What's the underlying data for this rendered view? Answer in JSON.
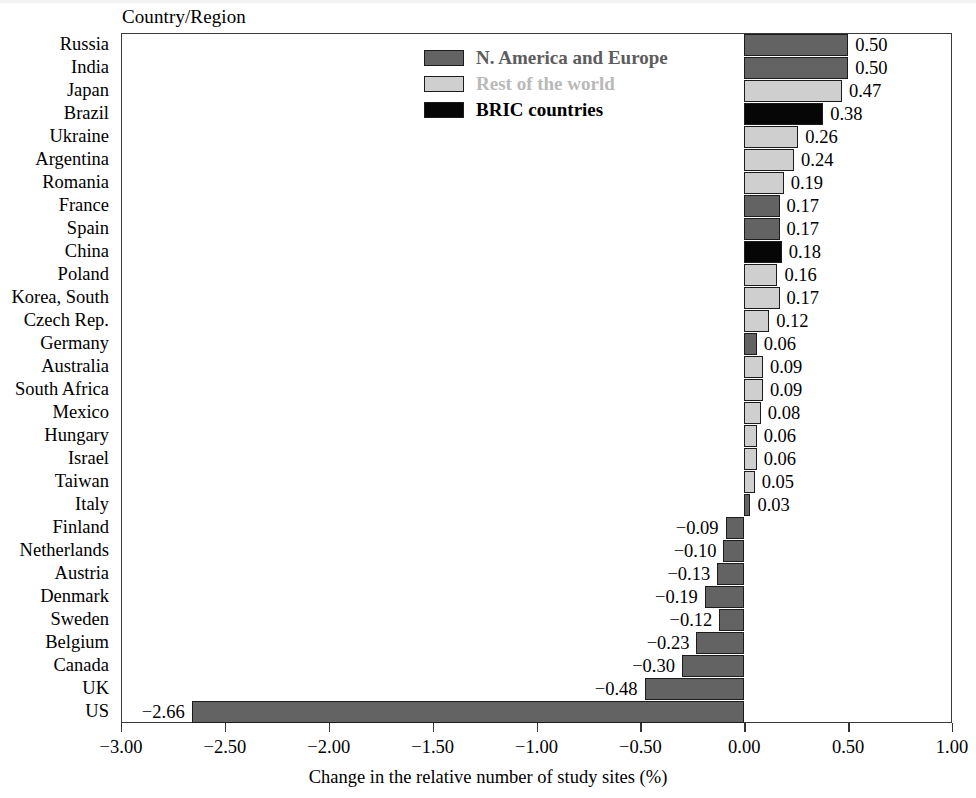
{
  "chart_data": {
    "type": "bar",
    "orientation": "horizontal",
    "title": "",
    "column_header": "Country/Region",
    "xlabel": "Change in the relative number of study sites (%)",
    "ylabel": "",
    "xlim": [
      -3.0,
      1.0
    ],
    "xticks": [
      -3.0,
      -2.5,
      -2.0,
      -1.5,
      -1.0,
      -0.5,
      0.0,
      0.5,
      1.0
    ],
    "xtick_labels": [
      "−3.00",
      "−2.50",
      "−2.00",
      "−1.50",
      "−1.00",
      "−0.50",
      "0.00",
      "0.50",
      "1.00"
    ],
    "grid": false,
    "legend_position": "upper-center",
    "categories": [
      "Russia",
      "India",
      "Japan",
      "Brazil",
      "Ukraine",
      "Argentina",
      "Romania",
      "France",
      "Spain",
      "China",
      "Poland",
      "Korea, South",
      "Czech Rep.",
      "Germany",
      "Australia",
      "South Africa",
      "Mexico",
      "Hungary",
      "Israel",
      "Taiwan",
      "Italy",
      "Finland",
      "Netherlands",
      "Austria",
      "Denmark",
      "Sweden",
      "Belgium",
      "Canada",
      "UK",
      "US"
    ],
    "values": [
      0.5,
      0.5,
      0.47,
      0.38,
      0.26,
      0.24,
      0.19,
      0.17,
      0.17,
      0.18,
      0.16,
      0.17,
      0.12,
      0.06,
      0.09,
      0.09,
      0.08,
      0.06,
      0.06,
      0.05,
      0.03,
      -0.09,
      -0.1,
      -0.13,
      -0.19,
      -0.12,
      -0.23,
      -0.3,
      -0.48,
      -2.66
    ],
    "value_labels": [
      "0.50",
      "0.50",
      "0.47",
      "0.38",
      "0.26",
      "0.24",
      "0.19",
      "0.17",
      "0.17",
      "0.18",
      "0.16",
      "0.17",
      "0.12",
      "0.06",
      "0.09",
      "0.09",
      "0.08",
      "0.06",
      "0.06",
      "0.05",
      "0.03",
      "−0.09",
      "−0.10",
      "−0.13",
      "−0.19",
      "−0.12",
      "−0.23",
      "−0.30",
      "−0.48",
      "−2.66"
    ],
    "groups": [
      "dark",
      "dark",
      "light",
      "black",
      "light",
      "light",
      "light",
      "dark",
      "dark",
      "black",
      "light",
      "light",
      "light",
      "dark",
      "light",
      "light",
      "light",
      "light",
      "light",
      "light",
      "dark",
      "dark",
      "dark",
      "dark",
      "dark",
      "dark",
      "dark",
      "dark",
      "dark",
      "dark"
    ],
    "series": [
      {
        "name": "N. America and Europe",
        "key": "dark",
        "color": "#636363",
        "members": [
          "Russia",
          "India",
          "France",
          "Spain",
          "Germany",
          "Italy",
          "Finland",
          "Netherlands",
          "Austria",
          "Denmark",
          "Sweden",
          "Belgium",
          "Canada",
          "UK",
          "US"
        ]
      },
      {
        "name": "Rest of the world",
        "key": "light",
        "color": "#cfcfcf",
        "members": [
          "Japan",
          "Ukraine",
          "Argentina",
          "Romania",
          "Poland",
          "Korea, South",
          "Czech Rep.",
          "Australia",
          "South Africa",
          "Mexico",
          "Hungary",
          "Israel",
          "Taiwan"
        ]
      },
      {
        "name": "BRIC countries",
        "key": "black",
        "color": "#060606",
        "members": [
          "Brazil",
          "China"
        ]
      }
    ]
  },
  "legend": {
    "items": [
      {
        "label": "N. America and Europe",
        "swatch": "dark"
      },
      {
        "label": "Rest of the world",
        "swatch": "light"
      },
      {
        "label": "BRIC countries",
        "swatch": "black"
      }
    ]
  },
  "axis": {
    "column_header": "Country/Region",
    "x_title": "Change in the relative number of study sites (%)"
  },
  "colors": {
    "dark": "#636363",
    "light": "#cfcfcf",
    "black": "#060606",
    "frame": "#3a3a3a",
    "legend_faded": "#b9b9b9"
  }
}
